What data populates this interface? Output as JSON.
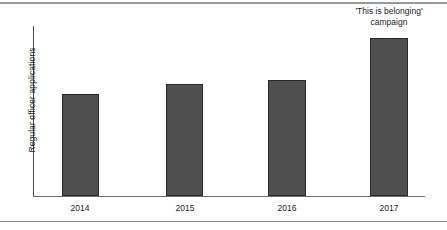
{
  "chart_data": {
    "type": "bar",
    "title": "",
    "subtitle": "",
    "xlabel": "",
    "ylabel": "Regular officer applications",
    "categories": [
      "2014",
      "2015",
      "2016",
      "2017"
    ],
    "values": [
      59,
      66,
      68,
      93
    ],
    "ylim": [
      0,
      100
    ],
    "grid": false,
    "legend": "none",
    "axis_has_tick_values": false,
    "annotations": [
      {
        "target_category": "2017",
        "lines": [
          "'This is belonging'",
          "campaign"
        ]
      }
    ],
    "series": [
      {
        "name": "Regular officer applications",
        "values": [
          59,
          66,
          68,
          93
        ]
      }
    ]
  },
  "style": {
    "bar_fill": "#4f4f4f",
    "bar_stroke": "#2b2b2b",
    "axis_color": "#4a4a4a",
    "rule_color": "#9a9a9a",
    "text_color": "#1d1d1d",
    "background": "#ffffff"
  },
  "geometry": {
    "bars": [
      {
        "left": 62,
        "top": 94,
        "width": 37,
        "height": 102
      },
      {
        "left": 166,
        "top": 84,
        "width": 37,
        "height": 112
      },
      {
        "left": 268,
        "top": 80,
        "width": 38,
        "height": 116
      },
      {
        "left": 370,
        "top": 38,
        "width": 38,
        "height": 158
      }
    ],
    "ticks": [
      {
        "left": 50
      },
      {
        "left": 155
      },
      {
        "left": 257
      },
      {
        "left": 359
      }
    ]
  }
}
